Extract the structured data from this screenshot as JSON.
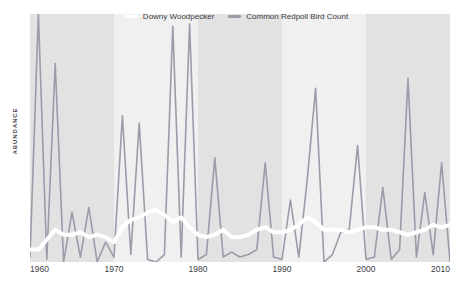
{
  "chart_data": {
    "type": "line",
    "title": "",
    "subtitle": "",
    "xlabel": "",
    "ylabel": "ABUNDANCE",
    "xlim": [
      1960,
      2010
    ],
    "ylim": [
      0,
      100
    ],
    "grid": false,
    "legend_position": "top-center",
    "x_ticks": [
      "1960",
      "1970",
      "1980",
      "1990",
      "2000",
      "2010"
    ],
    "x_tick_values": [
      1960,
      1970,
      1980,
      1990,
      2000,
      2010
    ],
    "y_ticks": [],
    "x": [
      1960,
      1961,
      1962,
      1963,
      1964,
      1965,
      1966,
      1967,
      1968,
      1969,
      1970,
      1971,
      1972,
      1973,
      1974,
      1975,
      1976,
      1977,
      1978,
      1979,
      1980,
      1981,
      1982,
      1983,
      1984,
      1985,
      1986,
      1987,
      1988,
      1989,
      1990,
      1991,
      1992,
      1993,
      1994,
      1995,
      1996,
      1997,
      1998,
      1999,
      2000,
      2001,
      2002,
      2003,
      2004,
      2005,
      2006,
      2007,
      2008,
      2009,
      2010
    ],
    "series": [
      {
        "name": "Common Redpoll Bird Count",
        "color": "#9b9baa",
        "width": 1.6,
        "values": [
          2,
          100,
          1,
          80,
          0,
          20,
          2,
          22,
          0,
          8,
          2,
          59,
          3,
          56,
          1,
          0,
          3,
          95,
          2,
          96,
          1,
          3,
          42,
          2,
          4,
          2,
          3,
          5,
          40,
          2,
          1,
          25,
          2,
          33,
          70,
          0,
          3,
          12,
          13,
          47,
          1,
          2,
          30,
          1,
          5,
          74,
          2,
          28,
          3,
          40,
          0
        ]
      },
      {
        "name": "Downy Woodpecker",
        "color": "#ffffff",
        "width": 4,
        "values": [
          5,
          5,
          9,
          13,
          11,
          11,
          12,
          10,
          11,
          10,
          8,
          14,
          17,
          18,
          20,
          21,
          19,
          16,
          18,
          14,
          11,
          10,
          11,
          13,
          10,
          10,
          11,
          13,
          14,
          12,
          12,
          13,
          15,
          18,
          16,
          13,
          13,
          13,
          12,
          13,
          14,
          14,
          13,
          13,
          12,
          11,
          12,
          13,
          15,
          14,
          15
        ]
      }
    ],
    "bands": [
      {
        "from": 1960,
        "to": 1970,
        "color": "#e2e2e2"
      },
      {
        "from": 1970,
        "to": 1980,
        "color": "#f0f0f0"
      },
      {
        "from": 1980,
        "to": 1990,
        "color": "#e2e2e2"
      },
      {
        "from": 1990,
        "to": 2000,
        "color": "#f0f0f0"
      },
      {
        "from": 2000,
        "to": 2010,
        "color": "#e2e2e2"
      }
    ]
  },
  "legend": {
    "items": [
      {
        "label": "Downy Woodpecker",
        "color": "#ffffff"
      },
      {
        "label": "Common Redpoll Bird Count",
        "color": "#9b9baa"
      }
    ]
  },
  "axes": {
    "y_title": "ABUNDANCE"
  }
}
